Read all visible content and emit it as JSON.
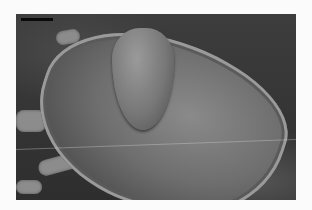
{
  "image": {
    "subject": "scanning electron micrograph of a mite (dorsal view)",
    "has_scale_bar": true,
    "scale_bar_label": "",
    "palette": {
      "background_border": "#fbfbfb",
      "backdrop": "#3a3a3a",
      "shell": "#6e6e6e",
      "scale_bar": "#0a0a0a"
    }
  }
}
